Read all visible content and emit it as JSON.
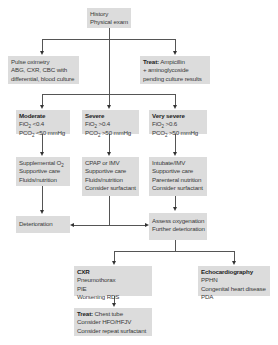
{
  "nodes": {
    "history": {
      "lines": [
        "History",
        "Physical exam"
      ]
    },
    "tests": {
      "lines": [
        "Pulse oximetry",
        "ABG, CXR, CBC with",
        "differential, blood culture"
      ]
    },
    "treat_antibiotics": {
      "label": "Treat:",
      "lines": [
        "Ampicillin",
        "+ aminoglycoside",
        "pending culture results"
      ]
    },
    "moderate": {
      "title": "Moderate",
      "fio2": "FiO",
      "fio2_val": " <0.4",
      "pco2": "PCO",
      "pco2_val": " <50 mmHg"
    },
    "severe": {
      "title": "Severe",
      "fio2": "FiO",
      "fio2_val": " >0.4",
      "pco2": "PCO",
      "pco2_val": " >50 mmHg"
    },
    "very_severe": {
      "title": "Very severe",
      "fio2": "FiO",
      "fio2_val": " >0.6",
      "pco2": "PCO",
      "pco2_val": " >50 mmHg"
    },
    "moderate_tx": {
      "line1": "Supplemental O",
      "sub": "2",
      "lines": [
        "Supportive care",
        "Fluids/nutrition"
      ]
    },
    "severe_tx": {
      "lines": [
        "CPAP or IMV",
        "Supportive care",
        "Fluids/nutrition",
        "Consider surfactant"
      ]
    },
    "very_severe_tx": {
      "lines": [
        "Intubate/IMV",
        "Supportive care",
        "Parenteral nutrition",
        "Consider surfactant"
      ]
    },
    "deterioration": {
      "lines": [
        "Deterioration"
      ]
    },
    "assess": {
      "lines": [
        "Assess oxygenation",
        "Further deterioration"
      ]
    },
    "cxr": {
      "title": "CXR",
      "lines": [
        "Pneumothorax",
        "PIE",
        "Worsening RDS"
      ]
    },
    "echo": {
      "title": "Echocardiography",
      "lines": [
        "PPHN",
        "Congenital heart disease",
        "PDA"
      ]
    },
    "treat_chest": {
      "label": "Treat:",
      "lines": [
        "Chest tube",
        "Consider HFO/HFJV",
        "Consider repeat surfactant"
      ]
    }
  },
  "subscript": "2",
  "colors": {
    "box": "#dcdcdc",
    "line": "#555555",
    "text": "#3a3a3a"
  }
}
